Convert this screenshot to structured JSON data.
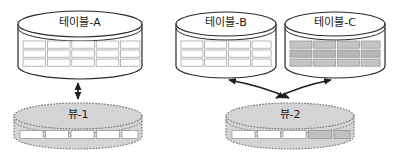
{
  "diagram": {
    "title_text_language": "ko",
    "background_color": "#ffffff",
    "stroke_color": "#2b2b2b",
    "table_fill": "#ffffff",
    "view_fill": "#d4d4d4",
    "view_stroke": "#6e6e6e",
    "cell_white": "#ffffff",
    "cell_gray": "#c0c0c0",
    "tables": [
      {
        "id": "table-a",
        "label": "테이블-A",
        "x": 18,
        "y": 11,
        "width": 124,
        "height": 68,
        "columns": 5,
        "rows": 3,
        "cells_shaded": false
      },
      {
        "id": "table-b",
        "label": "테이블-B",
        "x": 176,
        "y": 11,
        "width": 100,
        "height": 68,
        "columns": 4,
        "rows": 3,
        "cells_shaded": false
      },
      {
        "id": "table-c",
        "label": "테이블-C",
        "x": 285,
        "y": 11,
        "width": 100,
        "height": 68,
        "columns": 4,
        "rows": 3,
        "cells_shaded": true
      }
    ],
    "views": [
      {
        "id": "view-1",
        "label": "뷰-1",
        "x": 14,
        "y": 100,
        "width": 128,
        "height": 50,
        "cells": 5,
        "shaded_cells": []
      },
      {
        "id": "view-2",
        "label": "뷰-2",
        "x": 226,
        "y": 100,
        "width": 128,
        "height": 50,
        "cells": 5,
        "shaded_cells": [
          3,
          4
        ]
      }
    ],
    "connectors": [
      {
        "id": "connector-a-to-view1",
        "from": "table-a",
        "to": "view-1",
        "kind": "double-arrow-vertical"
      },
      {
        "id": "connector-b-to-view2",
        "from": "table-b",
        "to": "view-2",
        "kind": "double-arrow-curved"
      },
      {
        "id": "connector-c-to-view2",
        "from": "table-c",
        "to": "view-2",
        "kind": "double-arrow-curved"
      }
    ]
  }
}
